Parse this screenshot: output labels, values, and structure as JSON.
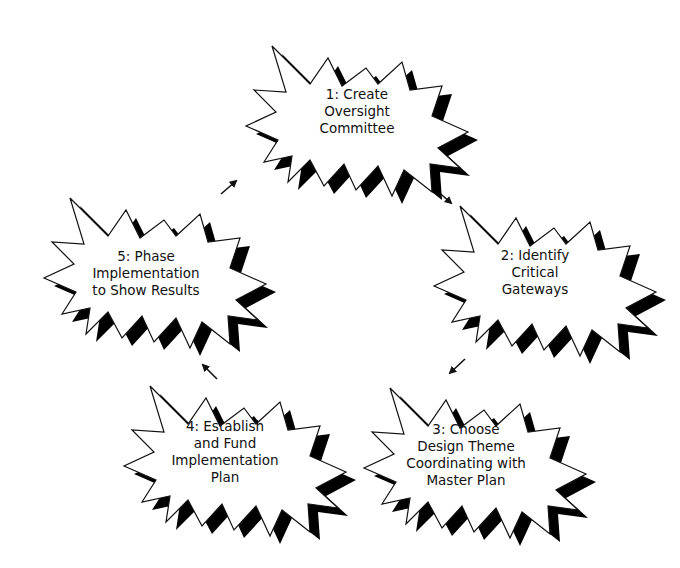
{
  "diagram": {
    "type": "cycle",
    "colors": {
      "outline": "#111111",
      "shadow": "#000000",
      "fill": "#ffffff",
      "text": "#111111"
    },
    "steps": [
      {
        "number": "1",
        "lines": [
          "1:  Create",
          "Oversight",
          "Committee"
        ]
      },
      {
        "number": "2",
        "lines": [
          "2:  Identify",
          "Critical",
          "Gateways"
        ]
      },
      {
        "number": "3",
        "lines": [
          "3:  Choose",
          "Design Theme",
          "Coordinating with",
          "Master Plan"
        ]
      },
      {
        "number": "4",
        "lines": [
          "4:  Establish",
          "and Fund",
          "Implementation",
          "Plan"
        ]
      },
      {
        "number": "5",
        "lines": [
          "5:  Phase",
          "Implementation",
          "to Show Results"
        ]
      }
    ],
    "arrows": [
      {
        "from": "1",
        "to": "2",
        "direction": "down-right"
      },
      {
        "from": "2",
        "to": "3",
        "direction": "down-left"
      },
      {
        "from": "3",
        "to": "4",
        "direction": "left"
      },
      {
        "from": "4",
        "to": "5",
        "direction": "up-left"
      },
      {
        "from": "5",
        "to": "1",
        "direction": "up-right"
      }
    ]
  }
}
